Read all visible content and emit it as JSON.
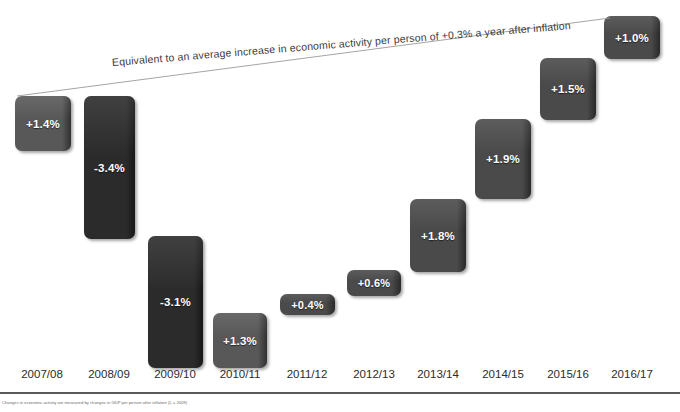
{
  "chart_data": {
    "type": "bar",
    "title": "",
    "subtitle": "",
    "xlabel": "",
    "ylabel": "",
    "grid": false,
    "legend": "none",
    "categories": [
      "2007/08",
      "2008/09",
      "2009/10",
      "2010/11",
      "2011/12",
      "2012/13",
      "2013/14",
      "2014/15",
      "2015/16",
      "2016/17"
    ],
    "values": [
      1.4,
      -3.4,
      -3.1,
      1.3,
      0.4,
      0.6,
      1.8,
      1.9,
      1.5,
      1.0
    ],
    "value_labels": [
      "+1.4%",
      "-3.4%",
      "-3.1%",
      "+1.3%",
      "+0.4%",
      "+0.6%",
      "+1.8%",
      "+1.9%",
      "+1.5%",
      "+1.0%"
    ],
    "annotations": [
      "Equivalent to an average increase in economic activity per person of +0.3% a year after inflation"
    ]
  },
  "annotation": {
    "text": "Equivalent to an average increase in economic activity per person of +0.3% a year after inflation"
  },
  "footnote": {
    "text": "Changes in economic activity are measured by changes in GDP per person after inflation (£ = 2009)"
  },
  "colors": {
    "bar_light": "#585858",
    "bar_dark": "#2b2b2b",
    "bar_mid": "#4a4a4a",
    "label_text": "#ffffff",
    "axis_text": "#2b2b2b",
    "axis_rule": "#5a5a5a",
    "background": "#ffffff",
    "annotation_text": "#3a3a3a"
  },
  "bars": [
    {
      "name": "bar-2007-08",
      "label": "+1.4%",
      "x": 15,
      "y": 96,
      "w": 56,
      "h": 55,
      "shade": "light",
      "tiny": false
    },
    {
      "name": "bar-2008-09",
      "label": "-3.4%",
      "x": 84,
      "y": 96,
      "w": 51,
      "h": 143,
      "shade": "dark",
      "tiny": false
    },
    {
      "name": "bar-2009-10",
      "label": "-3.1%",
      "x": 148,
      "y": 236,
      "w": 55,
      "h": 132,
      "shade": "dark",
      "tiny": false
    },
    {
      "name": "bar-2010-11",
      "label": "+1.3%",
      "x": 213,
      "y": 313,
      "w": 54,
      "h": 55,
      "shade": "light",
      "tiny": false
    },
    {
      "name": "bar-2011-12",
      "label": "+0.4%",
      "x": 280,
      "y": 294,
      "w": 55,
      "h": 21,
      "shade": "mid",
      "tiny": true
    },
    {
      "name": "bar-2012-13",
      "label": "+0.6%",
      "x": 347,
      "y": 270,
      "w": 54,
      "h": 26,
      "shade": "mid",
      "tiny": true
    },
    {
      "name": "bar-2013-14",
      "label": "+1.8%",
      "x": 410,
      "y": 199,
      "w": 56,
      "h": 73,
      "shade": "mid",
      "tiny": false
    },
    {
      "name": "bar-2014-15",
      "label": "+1.9%",
      "x": 475,
      "y": 119,
      "w": 56,
      "h": 80,
      "shade": "mid",
      "tiny": false
    },
    {
      "name": "bar-2015-16",
      "label": "+1.5%",
      "x": 540,
      "y": 58,
      "w": 56,
      "h": 62,
      "shade": "mid",
      "tiny": false
    },
    {
      "name": "bar-2016-17",
      "label": "+1.0%",
      "x": 604,
      "y": 16,
      "w": 56,
      "h": 43,
      "shade": "mid",
      "tiny": false
    }
  ],
  "axis": {
    "ticks": [
      {
        "label": "2007/08",
        "x": 42
      },
      {
        "label": "2008/09",
        "x": 109
      },
      {
        "label": "2009/10",
        "x": 175
      },
      {
        "label": "2010/11",
        "x": 240
      },
      {
        "label": "2011/12",
        "x": 307
      },
      {
        "label": "2012/13",
        "x": 374
      },
      {
        "label": "2013/14",
        "x": 438
      },
      {
        "label": "2014/15",
        "x": 503
      },
      {
        "label": "2015/16",
        "x": 568
      },
      {
        "label": "2016/17",
        "x": 632
      }
    ]
  }
}
